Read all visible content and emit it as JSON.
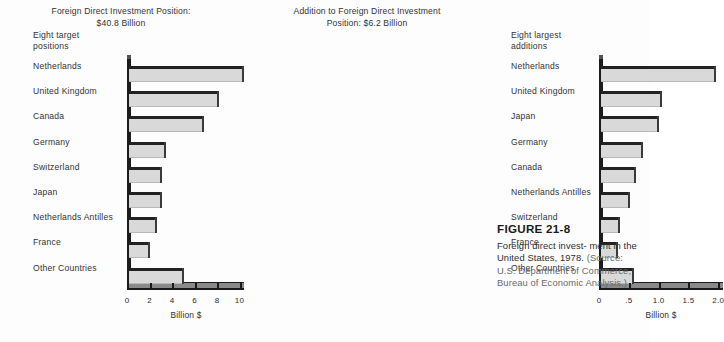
{
  "chart_data": [
    {
      "type": "bar",
      "orientation": "horizontal",
      "title": "Foreign Direct Investment Position:\n$40.8 Billion",
      "group_label": "Eight target\npositions",
      "xlabel": "Billion $",
      "ylabel": "",
      "xlim": [
        0,
        10.4
      ],
      "xticks": [
        0,
        2,
        4,
        6,
        8,
        10
      ],
      "xticklabels": [
        "0",
        "2",
        "4",
        "6",
        "8",
        "10"
      ],
      "grid": false,
      "legend": "none",
      "categories": [
        "Netherlands",
        "United Kingdom",
        "Canada",
        "Germany",
        "Switzerland",
        "Japan",
        "Netherlands Antilles",
        "France",
        "Other Countries"
      ],
      "values": [
        10.2,
        8.0,
        6.7,
        3.3,
        2.9,
        2.9,
        2.5,
        1.9,
        4.9
      ]
    },
    {
      "type": "bar",
      "orientation": "horizontal",
      "title": "Addition to Foreign Direct Investment\nPosition:  $6.2 Billion",
      "group_label": "Eight largest\nadditions",
      "xlabel": "Billion $",
      "ylabel": "",
      "xlim": [
        0,
        2.08
      ],
      "xticks": [
        0,
        0.5,
        1.0,
        1.5,
        2.0
      ],
      "xticklabels": [
        "0",
        ".5",
        "1.0",
        "1.5",
        "2.0"
      ],
      "grid": false,
      "legend": "none",
      "categories": [
        "Netherlands",
        "United Kingdom",
        "Japan",
        "Germany",
        "Canada",
        "Netherlands Antilles",
        "Switzerland",
        "France",
        "Other Countries"
      ],
      "values": [
        1.93,
        1.03,
        0.98,
        0.7,
        0.59,
        0.48,
        0.32,
        0.28,
        0.55
      ]
    }
  ],
  "figure": {
    "number": "FIGURE 21-8",
    "caption_main": "Foreign direct invest- ment in the United States, 1978.",
    "caption_source": "(Source: U.S. Department of Commerce, Bureau of Economic Analysis.)"
  },
  "colors": {
    "bar_fill": "#d9d9d9",
    "bar_cap": "#222222",
    "axis": "#1a1a1a",
    "text": "#2d2d2d",
    "background": "#fdfdfd"
  }
}
